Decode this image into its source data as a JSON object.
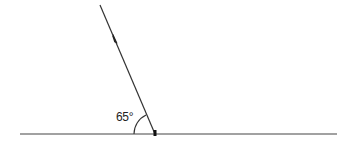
{
  "diagram": {
    "type": "angle-between-lines",
    "angle_label": "65°",
    "angle_degrees": 65,
    "colors": {
      "line": "#333333",
      "arc": "#333333",
      "marker": "#111111",
      "background": "#ffffff"
    },
    "horizontal_line": {
      "x1": 20,
      "y1": 134,
      "x2": 337,
      "y2": 134
    },
    "slanted_line": {
      "x1": 100,
      "y1": 5,
      "x2": 155,
      "y2": 134
    },
    "arc": {
      "cx": 155,
      "cy": 134,
      "r": 21
    }
  }
}
